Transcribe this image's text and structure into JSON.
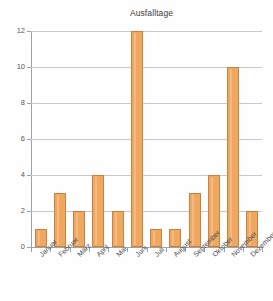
{
  "chart_data": {
    "type": "bar",
    "title": "Ausfalltage",
    "xlabel": "",
    "ylabel": "",
    "categories": [
      "Januar",
      "Februar",
      "März",
      "April",
      "Mai",
      "Juni",
      "Juli",
      "August",
      "September",
      "Oktober",
      "November",
      "Dezember"
    ],
    "values": [
      1,
      3,
      2,
      4,
      2,
      12,
      1,
      1,
      3,
      4,
      10,
      2
    ],
    "ylim": [
      0,
      12
    ],
    "ytick_labels": [
      "0",
      "2",
      "4",
      "6",
      "8",
      "10",
      "12"
    ],
    "ytick_values": [
      0,
      2,
      4,
      6,
      8,
      10,
      12
    ],
    "grid": true,
    "legend": false,
    "bar_color": "#f0a860",
    "bar_border_color": "#c8833f",
    "grid_color": "#c9c9c9",
    "axis_color": "#9aa3ad",
    "background_color": "#fefefe",
    "label_rotation": -45
  }
}
